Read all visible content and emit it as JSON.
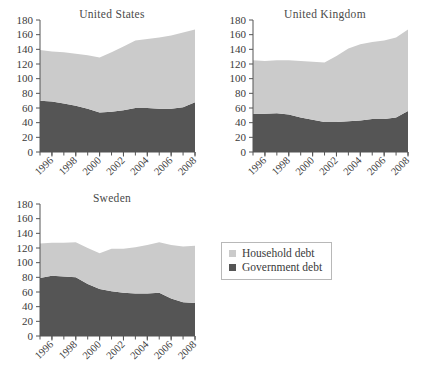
{
  "colors": {
    "household": "#cbcbcb",
    "government": "#555555",
    "axis": "#555555",
    "text": "#3a3a3a",
    "legend_border": "#b8b8b8",
    "background": "#ffffff"
  },
  "legend": {
    "position": "right-middle",
    "items": [
      {
        "label": "Household debt",
        "color": "#cbcbcb",
        "swatch": "legend-swatch-household"
      },
      {
        "label": "Government debt",
        "color": "#555555",
        "swatch": "legend-swatch-government"
      }
    ]
  },
  "axis_common": {
    "ylim": [
      0,
      180
    ],
    "yticks": [
      0,
      20,
      40,
      60,
      80,
      100,
      120,
      140,
      160,
      180
    ],
    "ytick_labels": [
      "0",
      "20",
      "40",
      "60",
      "80",
      "100",
      "120",
      "140",
      "160",
      "180"
    ],
    "xlim": [
      1995,
      2008
    ],
    "xtick_labels": [
      "1996",
      "1998",
      "2000",
      "2002",
      "2004",
      "2006",
      "2008"
    ],
    "xtick_values": [
      1996,
      1998,
      2000,
      2002,
      2004,
      2006,
      2008
    ],
    "xminor_values": [
      1995,
      1997,
      1999,
      2001,
      2003,
      2005,
      2007
    ],
    "grid": false,
    "xlabel": "",
    "ylabel": ""
  },
  "chart_data": [
    {
      "type": "area",
      "title": "United States",
      "stacked": true,
      "xlabel": "",
      "ylabel": "",
      "ylim": [
        0,
        180
      ],
      "yticks": [
        0,
        20,
        40,
        60,
        80,
        100,
        120,
        140,
        160,
        180
      ],
      "grid": false,
      "x": [
        1995,
        1996,
        1997,
        1998,
        1999,
        2000,
        2001,
        2002,
        2003,
        2004,
        2005,
        2006,
        2007,
        2008
      ],
      "xtick_labels": [
        "1996",
        "1998",
        "2000",
        "2002",
        "2004",
        "2006",
        "2008"
      ],
      "series": [
        {
          "name": "Government debt",
          "color": "#555555",
          "values": [
            70,
            69,
            66,
            63,
            59,
            54,
            55,
            57,
            60,
            60,
            59,
            59,
            61,
            68
          ]
        },
        {
          "name": "Household debt",
          "color": "#cbcbcb",
          "values": [
            69,
            68,
            70,
            71,
            73,
            75,
            81,
            87,
            92,
            94,
            97,
            100,
            102,
            99
          ]
        }
      ],
      "totals": [
        139,
        137,
        136,
        134,
        132,
        129,
        136,
        144,
        152,
        154,
        156,
        159,
        163,
        167
      ]
    },
    {
      "type": "area",
      "title": "United Kingdom",
      "stacked": true,
      "xlabel": "",
      "ylabel": "",
      "ylim": [
        0,
        180
      ],
      "yticks": [
        0,
        20,
        40,
        60,
        80,
        100,
        120,
        140,
        160,
        180
      ],
      "grid": false,
      "x": [
        1995,
        1996,
        1997,
        1998,
        1999,
        2000,
        2001,
        2002,
        2003,
        2004,
        2005,
        2006,
        2007,
        2008
      ],
      "xtick_labels": [
        "1996",
        "1998",
        "2000",
        "2002",
        "2004",
        "2006",
        "2008"
      ],
      "series": [
        {
          "name": "Government debt",
          "color": "#555555",
          "values": [
            52,
            52,
            53,
            51,
            47,
            44,
            41,
            41,
            42,
            43,
            45,
            45,
            47,
            56
          ]
        },
        {
          "name": "Household debt",
          "color": "#cbcbcb",
          "values": [
            73,
            72,
            72,
            74,
            77,
            79,
            81,
            90,
            99,
            104,
            105,
            107,
            109,
            111
          ]
        }
      ],
      "totals": [
        125,
        124,
        125,
        125,
        124,
        123,
        122,
        131,
        141,
        147,
        150,
        152,
        156,
        167
      ]
    },
    {
      "type": "area",
      "title": "Sweden",
      "stacked": true,
      "xlabel": "",
      "ylabel": "",
      "ylim": [
        0,
        180
      ],
      "yticks": [
        0,
        20,
        40,
        60,
        80,
        100,
        120,
        140,
        160,
        180
      ],
      "grid": false,
      "x": [
        1995,
        1996,
        1997,
        1998,
        1999,
        2000,
        2001,
        2002,
        2003,
        2004,
        2005,
        2006,
        2007,
        2008
      ],
      "xtick_labels": [
        "1996",
        "1998",
        "2000",
        "2002",
        "2004",
        "2006",
        "2008"
      ],
      "series": [
        {
          "name": "Government debt",
          "color": "#555555",
          "values": [
            79,
            82,
            81,
            80,
            71,
            64,
            61,
            59,
            58,
            58,
            59,
            51,
            46,
            45
          ]
        },
        {
          "name": "Household debt",
          "color": "#cbcbcb",
          "values": [
            47,
            45,
            46,
            48,
            49,
            49,
            58,
            60,
            63,
            66,
            69,
            73,
            76,
            78
          ]
        }
      ],
      "totals": [
        126,
        127,
        127,
        128,
        120,
        113,
        119,
        119,
        121,
        124,
        128,
        124,
        122,
        123
      ]
    }
  ]
}
